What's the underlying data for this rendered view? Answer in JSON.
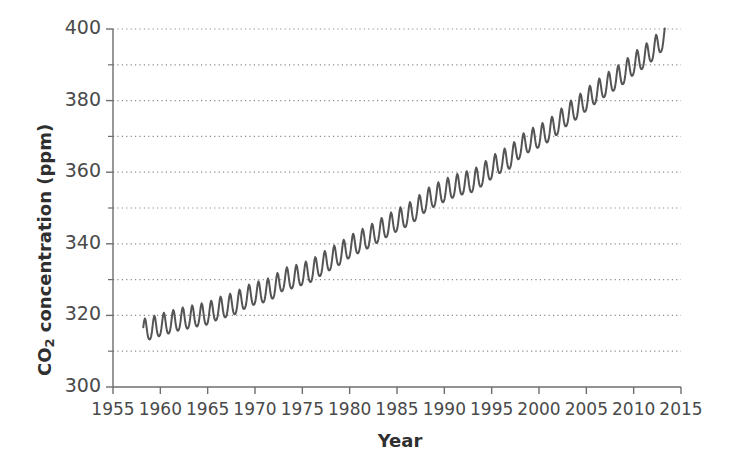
{
  "chart_data": {
    "type": "line",
    "title": "",
    "xlabel": "Year",
    "ylabel": "CO2 concentration (ppm)",
    "ylabel_parts": {
      "pre": "CO",
      "sub": "2",
      "post": " concentration (ppm)"
    },
    "xlim": [
      1955,
      2015
    ],
    "ylim": [
      300,
      400
    ],
    "xticks": [
      1955,
      1960,
      1965,
      1970,
      1975,
      1980,
      1985,
      1990,
      1995,
      2000,
      2005,
      2010,
      2015
    ],
    "xtick_labels": [
      "1955",
      "1960",
      "1965",
      "1970",
      "1975",
      "1980",
      "1985",
      "1990",
      "1995",
      "2000",
      "2005",
      "2010",
      "2015"
    ],
    "yticks": [
      300,
      320,
      340,
      360,
      380,
      400
    ],
    "ytick_labels": [
      "300",
      "320",
      "340",
      "360",
      "380",
      "400"
    ],
    "y_minor_gridlines": [
      310,
      330,
      350,
      370,
      390
    ],
    "grid": "horizontal-dotted",
    "grid_color": "#8a8a8a",
    "legend": "none",
    "line_color": "#555555",
    "line_width": 2.0,
    "series_name": "Atmospheric CO2 (monthly mean)",
    "seasonal_amplitude_ppm": 3.1,
    "x_start": 1958.2,
    "x_end": 2013.3,
    "annual_trend": [
      {
        "year": 1958,
        "value": 315.3
      },
      {
        "year": 1959,
        "value": 315.98
      },
      {
        "year": 1960,
        "value": 316.91
      },
      {
        "year": 1961,
        "value": 317.64
      },
      {
        "year": 1962,
        "value": 318.45
      },
      {
        "year": 1963,
        "value": 318.99
      },
      {
        "year": 1964,
        "value": 319.62
      },
      {
        "year": 1965,
        "value": 320.04
      },
      {
        "year": 1966,
        "value": 321.38
      },
      {
        "year": 1967,
        "value": 322.16
      },
      {
        "year": 1968,
        "value": 323.04
      },
      {
        "year": 1969,
        "value": 324.62
      },
      {
        "year": 1970,
        "value": 325.68
      },
      {
        "year": 1971,
        "value": 326.32
      },
      {
        "year": 1972,
        "value": 327.45
      },
      {
        "year": 1973,
        "value": 329.68
      },
      {
        "year": 1974,
        "value": 330.18
      },
      {
        "year": 1975,
        "value": 331.11
      },
      {
        "year": 1976,
        "value": 332.04
      },
      {
        "year": 1977,
        "value": 333.83
      },
      {
        "year": 1978,
        "value": 335.4
      },
      {
        "year": 1979,
        "value": 336.84
      },
      {
        "year": 1980,
        "value": 338.75
      },
      {
        "year": 1981,
        "value": 340.11
      },
      {
        "year": 1982,
        "value": 341.45
      },
      {
        "year": 1983,
        "value": 343.05
      },
      {
        "year": 1984,
        "value": 344.65
      },
      {
        "year": 1985,
        "value": 346.12
      },
      {
        "year": 1986,
        "value": 347.42
      },
      {
        "year": 1987,
        "value": 349.19
      },
      {
        "year": 1988,
        "value": 351.57
      },
      {
        "year": 1989,
        "value": 353.12
      },
      {
        "year": 1990,
        "value": 354.39
      },
      {
        "year": 1991,
        "value": 355.61
      },
      {
        "year": 1992,
        "value": 356.45
      },
      {
        "year": 1993,
        "value": 357.1
      },
      {
        "year": 1994,
        "value": 358.83
      },
      {
        "year": 1995,
        "value": 360.82
      },
      {
        "year": 1996,
        "value": 362.61
      },
      {
        "year": 1997,
        "value": 363.73
      },
      {
        "year": 1998,
        "value": 366.7
      },
      {
        "year": 1999,
        "value": 368.38
      },
      {
        "year": 2000,
        "value": 369.55
      },
      {
        "year": 2001,
        "value": 371.14
      },
      {
        "year": 2002,
        "value": 373.28
      },
      {
        "year": 2003,
        "value": 375.8
      },
      {
        "year": 2004,
        "value": 377.52
      },
      {
        "year": 2005,
        "value": 379.8
      },
      {
        "year": 2006,
        "value": 381.9
      },
      {
        "year": 2007,
        "value": 383.79
      },
      {
        "year": 2008,
        "value": 385.6
      },
      {
        "year": 2009,
        "value": 387.43
      },
      {
        "year": 2010,
        "value": 389.9
      },
      {
        "year": 2011,
        "value": 391.65
      },
      {
        "year": 2012,
        "value": 393.85
      },
      {
        "year": 2013,
        "value": 396.52
      }
    ]
  },
  "plot_box": {
    "left": 113,
    "top": 29,
    "right": 681,
    "bottom": 387
  }
}
